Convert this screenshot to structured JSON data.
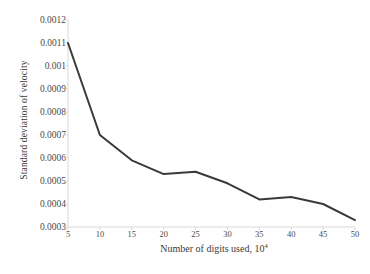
{
  "chart_data": {
    "type": "line",
    "title": "",
    "subtitle": "",
    "xlabel": "Number of digits used, 10",
    "xlabel_exponent": "4",
    "ylabel": "Standard deviation of velocity",
    "x": [
      5,
      10,
      15,
      20,
      25,
      30,
      35,
      40,
      45,
      50
    ],
    "values": [
      0.0011,
      0.0007,
      0.00059,
      0.00053,
      0.00054,
      0.00049,
      0.00042,
      0.00043,
      0.0004,
      0.00033
    ],
    "series": [
      {
        "name": "Standard deviation of velocity",
        "values": [
          0.0011,
          0.0007,
          0.00059,
          0.00053,
          0.00054,
          0.00049,
          0.00042,
          0.00043,
          0.0004,
          0.00033
        ]
      }
    ],
    "xlim": [
      5,
      50
    ],
    "ylim": [
      0.0003,
      0.0012
    ],
    "xticks": [
      5,
      10,
      15,
      20,
      25,
      30,
      35,
      40,
      45,
      50
    ],
    "xtick_labels": [
      "5",
      "10",
      "15",
      "20",
      "25",
      "30",
      "35",
      "40",
      "45",
      "50"
    ],
    "yticks": [
      0.0003,
      0.0004,
      0.0005,
      0.0006,
      0.0007,
      0.0008,
      0.0009,
      0.001,
      0.0011,
      0.0012
    ],
    "ytick_labels": [
      "0.0003",
      "0.0004",
      "0.0005",
      "0.0006",
      "0.0007",
      "0.0008",
      "0.0009",
      "0.001",
      "0.0011",
      "0.0012"
    ],
    "grid": false,
    "legend": false,
    "markers": false,
    "line_color": "#3a3a3a",
    "line_width": 2,
    "axis_color": "#d9d9d9",
    "background": "#ffffff"
  }
}
